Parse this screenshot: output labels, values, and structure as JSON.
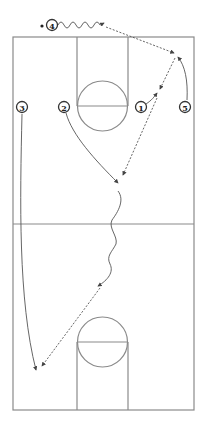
{
  "diagram": {
    "colors": {
      "court_line": "#8a8a8a",
      "action_line": "#555555",
      "player_outline": "#333333",
      "background": "#ffffff"
    },
    "court": {
      "outline": {
        "x": 13,
        "y": 37,
        "width": 181,
        "height": 373
      },
      "half_court_y": 224,
      "top_lane": {
        "x": 77,
        "y": 37,
        "width": 51,
        "free_throw_y": 106
      },
      "top_circle": {
        "cx": 102.5,
        "cy": 106,
        "r": 25
      },
      "bottom_lane": {
        "x": 77,
        "y": 342,
        "width": 51,
        "bottom_y": 410
      },
      "bottom_circle": {
        "cx": 102.5,
        "cy": 342,
        "r": 25
      }
    },
    "players": [
      {
        "id": "1",
        "label": "1",
        "x": 141,
        "y": 107,
        "has_ball": false
      },
      {
        "id": "2",
        "label": "2",
        "x": 64,
        "y": 107,
        "has_ball": false
      },
      {
        "id": "3",
        "label": "3",
        "x": 22,
        "y": 107,
        "has_ball": false
      },
      {
        "id": "4",
        "label": "4",
        "x": 52,
        "y": 25,
        "has_ball": true
      },
      {
        "id": "5",
        "label": "5",
        "x": 185,
        "y": 107,
        "has_ball": false
      }
    ],
    "actions": [
      {
        "type": "dribble",
        "from_player": "4",
        "description": "4 dribbles right along top"
      },
      {
        "type": "pass",
        "from_player": "4",
        "to_player": "5",
        "description": "Pass from 4 to 5 on right wing"
      },
      {
        "type": "cut",
        "player": "5",
        "description": "5 cuts up to receive pass"
      },
      {
        "type": "cut",
        "player": "1",
        "description": "1 cuts up to receive pass"
      },
      {
        "type": "pass",
        "from_player": "5",
        "to_player": "1",
        "description": "Pass from 5 to 1"
      },
      {
        "type": "pass",
        "from_player": "1",
        "to_player": "2",
        "description": "Pass from 1 to 2 in mid-court"
      },
      {
        "type": "cut",
        "player": "2",
        "description": "2 cuts down toward mid-court"
      },
      {
        "type": "dribble",
        "from_player": "2",
        "description": "2 dribbles down across half court"
      },
      {
        "type": "pass",
        "from_player": "2",
        "to_player": "3",
        "description": "Pass from 2 to 3 near bottom left"
      },
      {
        "type": "cut",
        "player": "3",
        "description": "3 runs down the left sideline"
      }
    ]
  }
}
